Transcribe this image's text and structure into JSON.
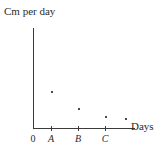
{
  "chart_data": {
    "type": "scatter",
    "title": "",
    "ylabel": "Cm per day",
    "xlabel": "Days",
    "grid": false,
    "legend": null,
    "xlim": [
      0,
      4.6
    ],
    "ylim": [
      0,
      5
    ],
    "x_tick_labels": [
      "0",
      "A",
      "B",
      "C"
    ],
    "x_tick_values": [
      0,
      1,
      2,
      3
    ],
    "y_tick_labels": [],
    "points": [
      {
        "x": 1,
        "y": 2.0,
        "px": 51,
        "py": 91
      },
      {
        "x": 2,
        "y": 1.15,
        "px": 78,
        "py": 108
      },
      {
        "x": 3,
        "y": 0.6,
        "px": 105,
        "py": 116
      },
      {
        "x": 4,
        "y": 0.5,
        "px": 125,
        "py": 118
      }
    ],
    "series": [
      {
        "name": "growth rate",
        "x": [
          1,
          2,
          3,
          4
        ],
        "values": [
          2.0,
          1.15,
          0.6,
          0.5
        ]
      }
    ]
  },
  "axes": {
    "y_label": "Cm per day",
    "x_label": "Days",
    "origin_label": "0",
    "tick_a": "A",
    "tick_b": "B",
    "tick_c": "C"
  },
  "colors": {
    "axis": "#3a3a3a",
    "point": "#4a4a4a",
    "text": "#2b2b2b",
    "background": "#ffffff"
  }
}
